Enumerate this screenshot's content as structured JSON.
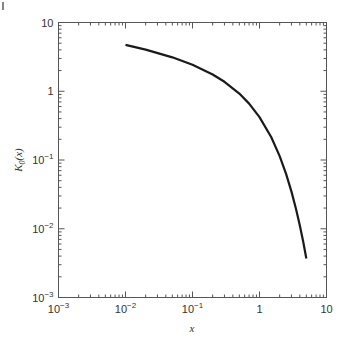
{
  "chart_data": {
    "type": "line",
    "title": "",
    "xlabel": "x",
    "ylabel": "K0(x)",
    "ylabel_display": {
      "base": "K",
      "subscript": "0",
      "suffix": "(x)"
    },
    "xscale": "log",
    "yscale": "log",
    "xlim": [
      0.001,
      10
    ],
    "ylim": [
      0.001,
      10
    ],
    "grid": false,
    "legend": null,
    "x_tick_labels": [
      {
        "value": 0.001,
        "base": "10",
        "exp": "−3"
      },
      {
        "value": 0.01,
        "base": "10",
        "exp": "−2"
      },
      {
        "value": 0.1,
        "base": "10",
        "exp": "−1"
      },
      {
        "value": 1,
        "base": "1",
        "exp": ""
      },
      {
        "value": 10,
        "base": "10",
        "exp": ""
      }
    ],
    "y_tick_labels": [
      {
        "value": 10,
        "base": "10",
        "exp": ""
      },
      {
        "value": 1,
        "base": "1",
        "exp": ""
      },
      {
        "value": 0.1,
        "base": "10",
        "exp": "−1"
      },
      {
        "value": 0.01,
        "base": "10",
        "exp": "−2"
      },
      {
        "value": 0.001,
        "base": "10",
        "exp": "−3"
      }
    ],
    "series": [
      {
        "name": "K0(x)",
        "color": "#1a1a1a",
        "x": [
          0.01,
          0.02,
          0.05,
          0.1,
          0.2,
          0.3,
          0.5,
          0.7,
          1.0,
          1.5,
          2.0,
          2.5,
          3.0,
          3.5,
          4.0,
          4.5,
          5.0
        ],
        "y": [
          4.7212,
          4.0285,
          3.1142,
          2.4271,
          1.7527,
          1.3725,
          0.9244,
          0.6605,
          0.421,
          0.2138,
          0.1139,
          0.0623,
          0.0347,
          0.0196,
          0.01116,
          0.0064,
          0.003691
        ]
      }
    ]
  },
  "page_marker": "|"
}
